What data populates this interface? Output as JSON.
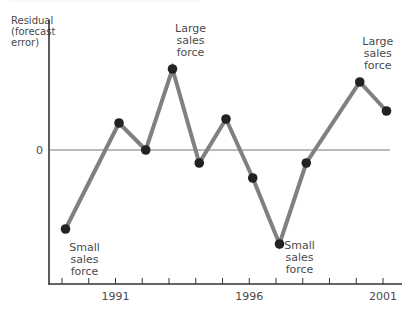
{
  "chart_data": {
    "type": "line",
    "title": "",
    "xlabel": "",
    "ylabel": "Residual (forecast error)",
    "ylabel_lines": [
      "Residual",
      "(forecast",
      "error)"
    ],
    "x_ticks": [
      1989,
      1990,
      1991,
      1992,
      1993,
      1994,
      1995,
      1996,
      1997,
      1998,
      1999,
      2000,
      2001
    ],
    "x_tick_labels": [
      "1991",
      "1996",
      "2001"
    ],
    "xlim": [
      1989,
      2001
    ],
    "y_tick_labels": [
      "0"
    ],
    "ylim": [
      -10,
      10
    ],
    "y_units_note": "relative units (no numeric scale shown except 0)",
    "grid": false,
    "reference_line": {
      "y": 0,
      "label": "0"
    },
    "series": [
      {
        "name": "Residual",
        "x": [
          1989,
          1991,
          1992,
          1993,
          1994,
          1995,
          1996,
          1997,
          1998,
          2000,
          2001
        ],
        "values": [
          -7.9,
          2.7,
          0.0,
          8.1,
          -1.3,
          3.1,
          -2.8,
          -9.4,
          -1.3,
          6.8,
          3.9
        ]
      }
    ],
    "annotations": [
      {
        "text": "Small sales force",
        "lines": [
          "Small",
          "sales",
          "force"
        ],
        "x": 1989,
        "position": "below-right"
      },
      {
        "text": "Large sales force",
        "lines": [
          "Large",
          "sales",
          "force"
        ],
        "x": 1993,
        "position": "above-right"
      },
      {
        "text": "Small sales force",
        "lines": [
          "Small",
          "sales",
          "force"
        ],
        "x": 1997,
        "position": "right"
      },
      {
        "text": "Large sales force",
        "lines": [
          "Large",
          "sales",
          "force"
        ],
        "x": 2000,
        "position": "above-right"
      }
    ]
  },
  "style": {
    "line_color": "#808080",
    "marker_color": "#222222",
    "axis_color": "#333333",
    "zero_line_color": "#777777",
    "text_color": "#4a4a4a"
  }
}
